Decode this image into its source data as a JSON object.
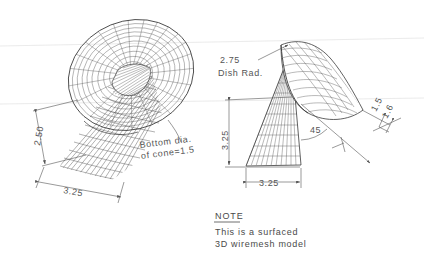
{
  "drawing": {
    "title": "3D surfaced wiremesh dish-and-cone assembly",
    "background_color": "#ffffff",
    "ink_color": "#3a3a3a",
    "dimension_color": "#555555"
  },
  "left_view": {
    "name": "pictorial-view",
    "dimensions": [
      {
        "id": "height",
        "value": "2.50",
        "orientation": "rotated-vertical"
      },
      {
        "id": "base-width",
        "value": "3.25",
        "orientation": "rotated-horizontal"
      }
    ],
    "leader_note": {
      "line1": "Bottom dia.",
      "line2": "of cone=1.5"
    }
  },
  "right_view": {
    "name": "elevation-view",
    "dimensions": [
      {
        "id": "dish-radius",
        "value": "2.75",
        "label": "Dish Rad."
      },
      {
        "id": "overall-height",
        "value": "3.25",
        "orientation": "vertical"
      },
      {
        "id": "base-width",
        "value": "3.25",
        "orientation": "horizontal"
      },
      {
        "id": "edge-a",
        "value": "1.5",
        "orientation": "rotated"
      },
      {
        "id": "edge-b",
        "value": "1.6",
        "orientation": "rotated"
      },
      {
        "id": "tilt-angle",
        "value": "45",
        "type": "angular"
      }
    ],
    "dish_radius_label_line1": "2.75",
    "dish_radius_label_line2": "Dish  Rad."
  },
  "note_block": {
    "heading": "NOTE",
    "line1": "This  is  a  surfaced",
    "line2": "3D  wiremesh  model"
  }
}
